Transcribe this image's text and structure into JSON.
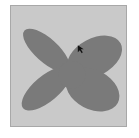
{
  "canvas": {
    "background": "#c9c9c9",
    "border": "#a8a8a8"
  },
  "shape": {
    "type": "four-petal-butterfly",
    "fill": "#7a7a7a"
  },
  "cursor": {
    "icon": "pointer-cursor-icon",
    "x": 78,
    "y": 46
  }
}
